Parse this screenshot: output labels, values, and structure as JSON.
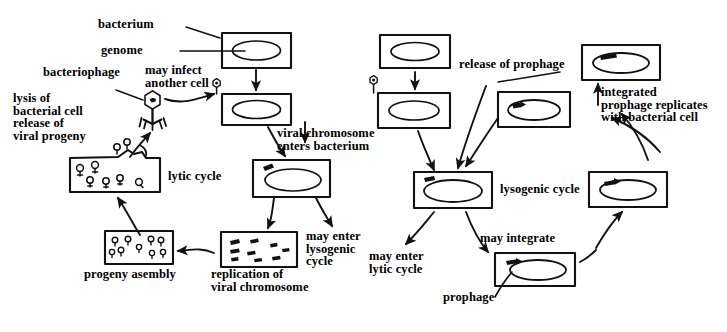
{
  "diagram": {
    "ink_color": "#111111",
    "background_color": "#ffffff"
  },
  "labels": {
    "bacterium": "bacterium",
    "genome": "genome",
    "bacteriophage": "bacteriophage",
    "may_infect_another_cell": "may infect\nanother cell",
    "lysis_release": "lysis of\nbacterial cell\nrelease of\nviral progeny",
    "lytic_cycle": "lytic cycle",
    "viral_chromosome_enters": "viral chromosome\nenters bacterium",
    "may_enter_lysogenic_cycle": "may enter\nlysogenic\ncycle",
    "progeny_assembly": "progeny asembly",
    "replication_of_viral_chromosome": "replication of\nviral chromosome",
    "release_of_prophage": "release of prophage",
    "integrated_prophage_replicates": "integrated\nprophage replicates\nwith bacterial cell",
    "lysogenic_cycle": "lysogenic cycle",
    "may_enter_lytic_cycle": "may enter\nlytic cycle",
    "may_integrate": "may integrate",
    "prophage": "prophage"
  },
  "cells": [
    {
      "id": "healthy-bacterium-left",
      "caption": "bacterium",
      "contents": "genome"
    },
    {
      "id": "infected-bacterium-left",
      "caption": "",
      "contents": "genome with attached phage"
    },
    {
      "id": "bacterium-with-viral-chromosome",
      "caption": "",
      "contents": "genome plus viral chromosome"
    },
    {
      "id": "replication-cell",
      "caption": "replication of viral chromosome",
      "contents": "replicated viral chromosomes"
    },
    {
      "id": "progeny-assembly-cell",
      "caption": "progeny asembly",
      "contents": "assembled phage particles"
    },
    {
      "id": "lysing-cell",
      "caption": "lysis of bacterial cell release of viral progeny",
      "contents": "free phage particles, ruptured wall"
    },
    {
      "id": "healthy-bacterium-right",
      "caption": "bacterium",
      "contents": "genome"
    },
    {
      "id": "infected-bacterium-right",
      "caption": "",
      "contents": "genome with attached phage"
    },
    {
      "id": "lysogenic-cell-left",
      "caption": "lysogenic cycle",
      "contents": "genome with prophage"
    },
    {
      "id": "prophage-cell",
      "caption": "prophage",
      "contents": "genome with integrated prophage"
    },
    {
      "id": "lysogenic-cell-right",
      "caption": "",
      "contents": "genome with prophage"
    },
    {
      "id": "released-prophage-cell",
      "caption": "release of prophage",
      "contents": "genome with prophage"
    },
    {
      "id": "replicated-lysogen-cell",
      "caption": "integrated prophage replicates with bacterial cell",
      "contents": "genome with prophage"
    }
  ]
}
